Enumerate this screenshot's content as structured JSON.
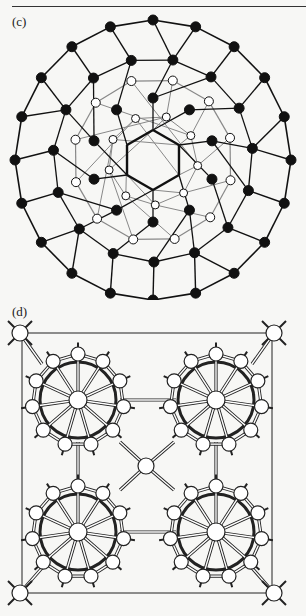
{
  "figure": {
    "panels": [
      {
        "id": "c",
        "label": "(c)",
        "description": "Polyhedral cluster framework with filled (black) and open (white) atoms, central hexagon"
      },
      {
        "id": "d",
        "label": "(d)",
        "description": "Unit cell projection with four icosahedral-like clusters linked through central atom, corner atoms"
      }
    ]
  },
  "colors": {
    "background": "#f7f7f5",
    "line_dark": "#111111",
    "line_light": "#888888",
    "atom_filled": "#111111",
    "atom_open": "#ffffff"
  }
}
